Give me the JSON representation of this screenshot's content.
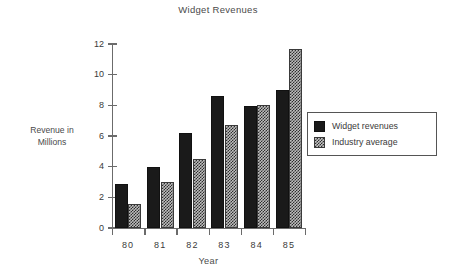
{
  "chart_data": {
    "type": "bar",
    "title": "Widget Revenues",
    "xlabel": "Year",
    "ylabel_line1": "Revenue in",
    "ylabel_line2": "Millions",
    "categories": [
      "80",
      "81",
      "82",
      "83",
      "84",
      "85"
    ],
    "yticks": [
      "12",
      "10",
      "8",
      "6",
      "4",
      "2",
      "0"
    ],
    "ytick_values": [
      12,
      10,
      8,
      6,
      4,
      2,
      0
    ],
    "ylim": [
      0,
      12
    ],
    "grid": false,
    "legend_position": "right",
    "series": [
      {
        "name": "Widget revenues",
        "fill": "solid-black",
        "color": "#1a1a1a",
        "values": [
          2.85,
          4.0,
          6.2,
          8.6,
          7.95,
          9.0
        ]
      },
      {
        "name": "Industry average",
        "fill": "checkered",
        "color": "#bdbdbd",
        "values": [
          1.55,
          3.0,
          4.5,
          6.7,
          8.0,
          11.7
        ]
      }
    ]
  },
  "colors": {
    "background": "#ffffff",
    "axis": "#6b6b6b",
    "text": "#3a3a3a",
    "widget_bar": "#1a1a1a",
    "industry_bar": "#bdbdbd",
    "legend_border": "#555555"
  }
}
